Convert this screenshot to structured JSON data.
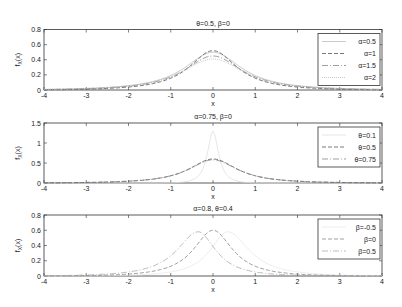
{
  "chart_data": [
    {
      "type": "line",
      "title": "θ=0.5, β=0",
      "xlabel": "x",
      "ylabel": "f_X(x)",
      "xlim": [
        -4,
        4
      ],
      "ylim": [
        0,
        0.8
      ],
      "xticks": [
        "-4",
        "-3",
        "-2",
        "-1",
        "0",
        "1",
        "2",
        "3",
        "4"
      ],
      "yticks": [
        "0",
        "0.2",
        "0.4",
        "0.6",
        "0.8"
      ],
      "grid": false,
      "legend_position": "upper right",
      "series": [
        {
          "name": "α=0.5",
          "peak_x": 0,
          "peak_y": 0.5,
          "color": "#bdbdbd",
          "dash": "none"
        },
        {
          "name": "α=1",
          "peak_x": 0,
          "peak_y": 0.52,
          "color": "#555555",
          "dash": "4,2"
        },
        {
          "name": "α=1.5",
          "peak_x": 0,
          "peak_y": 0.45,
          "color": "#888888",
          "dash": "6,2,1,2"
        },
        {
          "name": "α=2",
          "peak_x": 0,
          "peak_y": 0.41,
          "color": "#bbbbbb",
          "dash": "1,1"
        }
      ]
    },
    {
      "type": "line",
      "title": "α=0.75, β=0",
      "xlabel": "x",
      "ylabel": "f_X(x)",
      "xlim": [
        -4,
        4
      ],
      "ylim": [
        0,
        1.5
      ],
      "xticks": [
        "-4",
        "-3",
        "-2",
        "-1",
        "0",
        "1",
        "2",
        "3",
        "4"
      ],
      "yticks": [
        "0",
        "0.5",
        "1",
        "1.5"
      ],
      "grid": false,
      "legend_position": "upper right",
      "series": [
        {
          "name": "θ=0.1",
          "peak_x": 0,
          "peak_y": 1.3,
          "color": "#e0e0e0",
          "dash": "none"
        },
        {
          "name": "θ=0.5",
          "peak_x": 0,
          "peak_y": 0.6,
          "color": "#555555",
          "dash": "4,2"
        },
        {
          "name": "θ=0.75",
          "peak_x": 0,
          "peak_y": 0.58,
          "color": "#888888",
          "dash": "6,2,1,2"
        }
      ]
    },
    {
      "type": "line",
      "title": "α=0.8, θ=0.4",
      "xlabel": "x",
      "ylabel": "f_X(x)",
      "xlim": [
        -4,
        4
      ],
      "ylim": [
        0,
        0.8
      ],
      "xticks": [
        "-4",
        "-3",
        "-2",
        "-1",
        "0",
        "1",
        "2",
        "3",
        "4"
      ],
      "yticks": [
        "0",
        "0.2",
        "0.4",
        "0.6",
        "0.8"
      ],
      "grid": false,
      "legend_position": "upper right",
      "series": [
        {
          "name": "β=-0.5",
          "peak_x": 0.35,
          "peak_y": 0.58,
          "color": "#e8e8e8",
          "dash": "none"
        },
        {
          "name": "β=0",
          "peak_x": 0.0,
          "peak_y": 0.6,
          "color": "#888888",
          "dash": "4,2"
        },
        {
          "name": "β=0.5",
          "peak_x": -0.35,
          "peak_y": 0.58,
          "color": "#aaaaaa",
          "dash": "6,2,1,2"
        }
      ]
    }
  ]
}
